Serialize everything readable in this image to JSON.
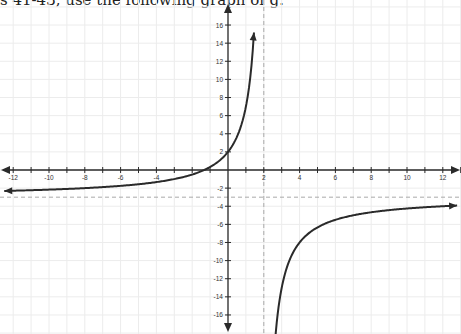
{
  "header": {
    "text": "s 41-43, use the following graph of g."
  },
  "chart_data": {
    "type": "line",
    "title": "",
    "xlabel": "",
    "ylabel": "",
    "xlim": [
      -12.6,
      13
    ],
    "ylim": [
      -18,
      18.5
    ],
    "grid": true,
    "x_ticks": [
      -12,
      -10,
      -8,
      -6,
      -4,
      -2,
      2,
      4,
      6,
      8,
      10,
      12
    ],
    "x_tick_labels": [
      "-12",
      "-10",
      "-8",
      "-6",
      "-4",
      "",
      "2",
      "4",
      "6",
      "8",
      "10",
      "12"
    ],
    "y_ticks": [
      16,
      14,
      12,
      10,
      8,
      6,
      4,
      2,
      -2,
      -4,
      -6,
      -8,
      -10,
      -12,
      -14,
      -16
    ],
    "y_tick_labels": [
      "16",
      "14",
      "12",
      "10",
      "8",
      "6",
      "4",
      "2",
      "-2",
      "-4",
      "-6",
      "-8",
      "-10",
      "-12",
      "-14",
      "-16"
    ],
    "function": "g(x) = -10/(x-2) - 3",
    "asymptotes": {
      "vertical_x": 2,
      "horizontal_y": -3
    },
    "series": [
      {
        "name": "g left branch",
        "x": [
          -12.5,
          -12,
          -10,
          -8,
          -6,
          -4,
          -2,
          -1,
          0,
          0.5,
          1,
          1.25,
          1.45
        ],
        "y": [
          -2.3,
          -2.29,
          -2.17,
          -2.0,
          -1.75,
          -1.33,
          -0.5,
          0.33,
          2.0,
          3.67,
          7.0,
          10.33,
          15.2
        ]
      },
      {
        "name": "g right branch",
        "x": [
          2.55,
          2.75,
          3,
          3.5,
          4,
          5,
          6,
          8,
          10,
          12,
          12.8
        ],
        "y": [
          -21.2,
          -16.33,
          -13.0,
          -9.67,
          -8.0,
          -6.33,
          -5.5,
          -4.67,
          -4.25,
          -4.0,
          -3.93
        ]
      }
    ],
    "colors": {
      "curve": "#2a2a2a",
      "axis": "#2a2a2a",
      "grid": "#ececec",
      "asymptote": "#aaaaaa"
    }
  }
}
